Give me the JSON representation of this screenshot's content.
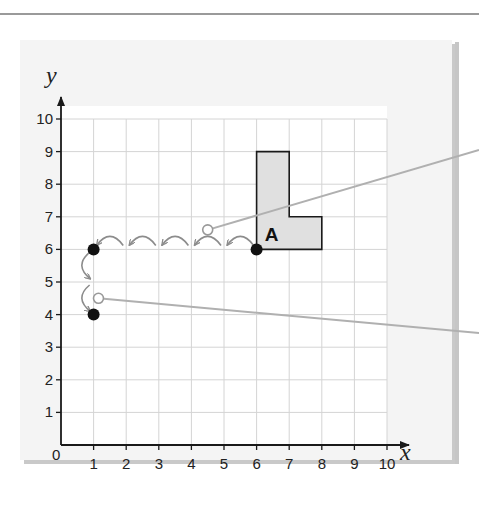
{
  "diagram": {
    "axes": {
      "x_label": "x",
      "y_label": "y",
      "origin_label": "0",
      "x_ticks": [
        "1",
        "2",
        "3",
        "4",
        "5",
        "6",
        "7",
        "8",
        "9",
        "10"
      ],
      "y_ticks": [
        "1",
        "2",
        "3",
        "4",
        "5",
        "6",
        "7",
        "8",
        "9",
        "10"
      ],
      "x_range": [
        0,
        10
      ],
      "y_range": [
        0,
        10
      ]
    },
    "shape": {
      "label": "A",
      "vertices": [
        [
          6,
          6
        ],
        [
          8,
          6
        ],
        [
          8,
          7
        ],
        [
          7,
          7
        ],
        [
          7,
          9
        ],
        [
          6,
          9
        ]
      ],
      "fill": "#e0e0e0",
      "stroke": "#1a1a1a"
    },
    "points": [
      {
        "x": 6,
        "y": 6,
        "style": "filled"
      },
      {
        "x": 1,
        "y": 6,
        "style": "filled"
      },
      {
        "x": 1,
        "y": 4,
        "style": "filled"
      }
    ],
    "hops": {
      "horizontal": {
        "from": [
          6,
          6
        ],
        "to": [
          1,
          6
        ],
        "count": 5
      },
      "vertical": {
        "from": [
          1,
          6
        ],
        "to": [
          1,
          4
        ],
        "count": 2
      }
    },
    "callouts": [
      {
        "anchor": [
          4.5,
          6.6
        ],
        "style": "open-circle"
      },
      {
        "anchor": [
          1.15,
          4.5
        ],
        "style": "open-circle"
      }
    ],
    "colors": {
      "grid": "#d4d4d4",
      "axis": "#1a1a1a",
      "hop_arrow": "#8c8c8c",
      "callout_line": "#b0b0b0",
      "panel": "#f4f4f4"
    }
  }
}
